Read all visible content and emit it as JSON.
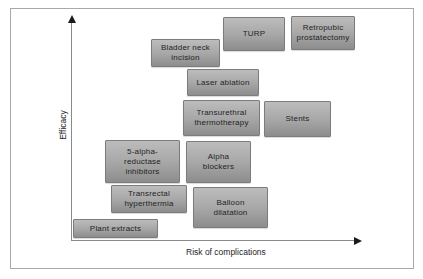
{
  "figure": {
    "axes": {
      "x_label": "Risk of complications",
      "y_label": "Efficacy"
    },
    "colors": {
      "background": "#ffffff",
      "frame_border": "#a9a9a9",
      "box_fill_top": "#bcbcbc",
      "box_fill_bottom": "#8d8d8d",
      "box_border": "#7c7c7c",
      "text": "#242424",
      "axis_line": "#8a8a8a",
      "arrowhead": "#1a1a1a"
    },
    "treatments": [
      {
        "id": "turp",
        "label": "TURP",
        "lines": [
          "TURP"
        ],
        "x": 223,
        "y": 17,
        "w": 62,
        "h": 34
      },
      {
        "id": "retropubic-prostatectomy",
        "label": "Retropubic prostatectomy",
        "lines": [
          "Retropubic",
          "prostatectomy"
        ],
        "x": 291,
        "y": 16,
        "w": 64,
        "h": 34
      },
      {
        "id": "bladder-neck-incision",
        "label": "Bladder neck incision",
        "lines": [
          "Bladder neck",
          "incision"
        ],
        "x": 151,
        "y": 39,
        "w": 69,
        "h": 28
      },
      {
        "id": "laser-ablation",
        "label": "Laser ablation",
        "lines": [
          "Laser ablation"
        ],
        "x": 187,
        "y": 69,
        "w": 72,
        "h": 27
      },
      {
        "id": "transurethral-thermotherapy",
        "label": "Transurethral thermotherapy",
        "lines": [
          "Transurethral",
          "thermotherapy"
        ],
        "x": 183,
        "y": 100,
        "w": 77,
        "h": 36
      },
      {
        "id": "stents",
        "label": "Stents",
        "lines": [
          "Stents"
        ],
        "x": 264,
        "y": 101,
        "w": 67,
        "h": 36
      },
      {
        "id": "five-alpha-reductase-inhibitors",
        "label": "5-alpha-reductase inhibitors",
        "lines": [
          "5-alpha-",
          "reductase",
          "inhibitors"
        ],
        "x": 105,
        "y": 140,
        "w": 75,
        "h": 43
      },
      {
        "id": "alpha-blockers",
        "label": "Alpha blockers",
        "lines": [
          "Alpha",
          "blockers"
        ],
        "x": 186,
        "y": 141,
        "w": 65,
        "h": 42
      },
      {
        "id": "transrectal-hyperthermia",
        "label": "Transrectal hyperthermia",
        "lines": [
          "Transrectal",
          "hyperthermia"
        ],
        "x": 111,
        "y": 185,
        "w": 76,
        "h": 28
      },
      {
        "id": "balloon-dilatation",
        "label": "Balloon dilatation",
        "lines": [
          "Balloon",
          "dilatation"
        ],
        "x": 193,
        "y": 187,
        "w": 75,
        "h": 41
      },
      {
        "id": "plant-extracts",
        "label": "Plant extracts",
        "lines": [
          "Plant extracts"
        ],
        "x": 73,
        "y": 219,
        "w": 85,
        "h": 19
      }
    ]
  }
}
